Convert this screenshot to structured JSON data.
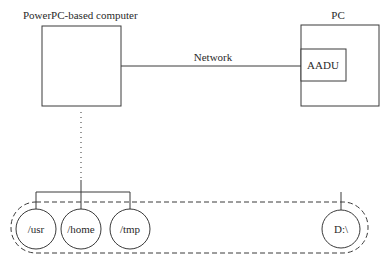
{
  "diagram": {
    "powerpc": {
      "label": "PowerPC-based computer"
    },
    "network": {
      "label": "Network"
    },
    "pc": {
      "label": "PC",
      "inner_label": "AADU"
    },
    "filesystems": [
      {
        "label": "/usr"
      },
      {
        "label": "/home"
      },
      {
        "label": "/tmp"
      },
      {
        "label": "D:\\"
      }
    ]
  },
  "colors": {
    "stroke": "#3a3a3a",
    "text": "#2a2a2a",
    "background": "#ffffff"
  }
}
